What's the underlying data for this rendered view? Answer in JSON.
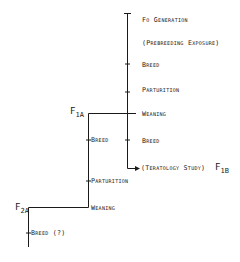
{
  "diagram": {
    "main_line": {
      "labels": [
        "Fo Generation",
        "(Prebreeding Exposure)",
        "Breed",
        "Parturition",
        "Weaning",
        "Breed"
      ],
      "end_label": "(Teratology Study)",
      "end_generation": {
        "base": "F",
        "sub": "1B"
      }
    },
    "f1a_line": {
      "generation": {
        "base": "F",
        "sub": "1A"
      },
      "labels": [
        "Breed",
        "Parturition",
        "Weaning"
      ]
    },
    "f2a_line": {
      "generation": {
        "base": "F",
        "sub": "2A"
      },
      "labels": [
        "Breed (?)"
      ]
    },
    "line_color": "#1a1a1a"
  }
}
